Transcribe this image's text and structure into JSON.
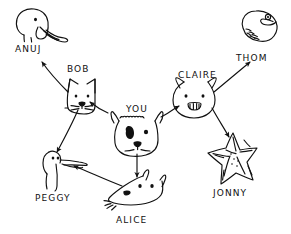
{
  "diagram": {
    "style": "hand-drawn ink",
    "ink_color": "#111111",
    "background_color": "#ffffff",
    "nodes": [
      {
        "id": "anuj",
        "label": "ANUJ",
        "creature": "elephant",
        "label_x": 15,
        "label_y": 44,
        "icon_x": 18,
        "icon_y": 8
      },
      {
        "id": "bob",
        "label": "BOB",
        "creature": "cat",
        "label_x": 67,
        "label_y": 64,
        "icon_x": 62,
        "icon_y": 78
      },
      {
        "id": "you",
        "label": "YOU",
        "creature": "dog",
        "label_x": 126,
        "label_y": 104,
        "icon_x": 119,
        "icon_y": 114
      },
      {
        "id": "claire",
        "label": "CLAIRE",
        "creature": "pig",
        "label_x": 178,
        "label_y": 70,
        "icon_x": 180,
        "icon_y": 80
      },
      {
        "id": "thom",
        "label": "THOM",
        "creature": "fish",
        "label_x": 236,
        "label_y": 53,
        "icon_x": 238,
        "icon_y": 9
      },
      {
        "id": "peggy",
        "label": "PEGGY",
        "creature": "bird",
        "label_x": 35,
        "label_y": 193,
        "icon_x": 42,
        "icon_y": 146
      },
      {
        "id": "alice",
        "label": "ALICE",
        "creature": "fox",
        "label_x": 116,
        "label_y": 215,
        "icon_x": 110,
        "icon_y": 172
      },
      {
        "id": "jonny",
        "label": "JONNY",
        "creature": "starfish",
        "label_x": 213,
        "label_y": 188,
        "icon_x": 206,
        "icon_y": 130
      }
    ],
    "edges": [
      {
        "from": "you",
        "to": "bob",
        "arrow": "single"
      },
      {
        "from": "bob",
        "to": "anuj",
        "arrow": "single"
      },
      {
        "from": "bob",
        "to": "peggy",
        "arrow": "single"
      },
      {
        "from": "you",
        "to": "alice",
        "arrow": "single"
      },
      {
        "from": "alice",
        "to": "peggy",
        "arrow": "single"
      },
      {
        "from": "you",
        "to": "claire",
        "arrow": "single"
      },
      {
        "from": "claire",
        "to": "thom",
        "arrow": "single"
      },
      {
        "from": "claire",
        "to": "jonny",
        "arrow": "single"
      }
    ]
  }
}
